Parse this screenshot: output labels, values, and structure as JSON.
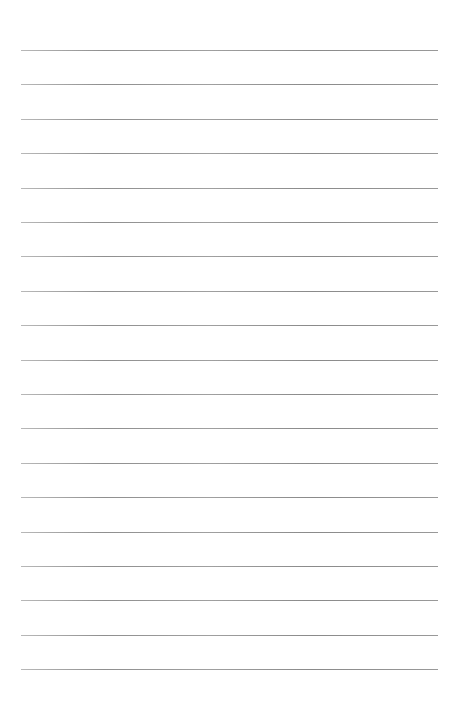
{
  "page": {
    "type": "lined-paper",
    "background": "#ffffff",
    "line_color": "#909090",
    "line_count": 19,
    "line_start_y": 50,
    "line_spacing": 34.4,
    "line_left": 21,
    "line_width": 417,
    "content": ""
  }
}
